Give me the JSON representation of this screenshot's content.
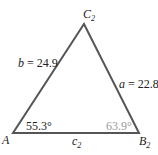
{
  "diagram": {
    "type": "triangle",
    "line_color": "#555555",
    "vertices": {
      "A": {
        "label": "A",
        "subscript": ""
      },
      "B": {
        "label": "B",
        "subscript": "2"
      },
      "C": {
        "label": "C",
        "subscript": "2"
      }
    },
    "sides": {
      "a": {
        "name": "a",
        "eq": " = 22.8"
      },
      "b": {
        "name": "b",
        "eq": " = 24.9"
      },
      "c": {
        "name": "c",
        "subscript": "2"
      }
    },
    "angles": {
      "A": {
        "value": "55.3°",
        "color": "#222222"
      },
      "B": {
        "value": "63.9°",
        "color": "#9a9a9a"
      }
    }
  }
}
